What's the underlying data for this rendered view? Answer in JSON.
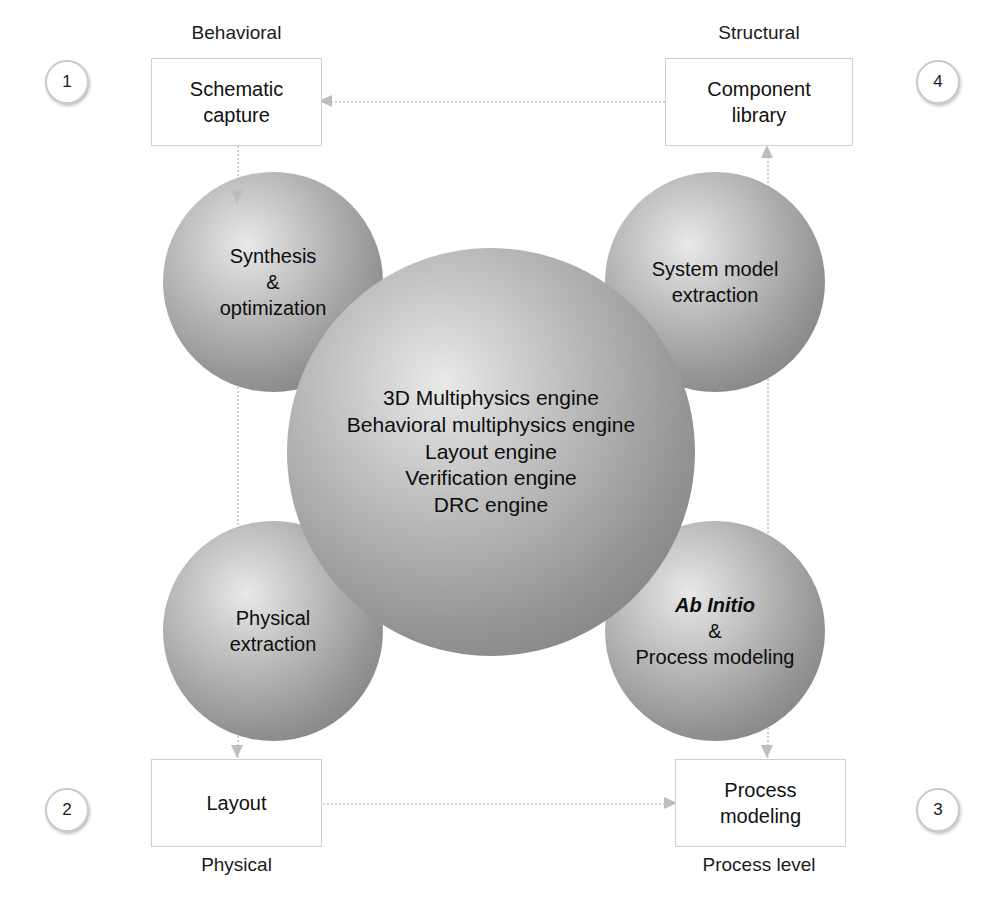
{
  "diagram": {
    "zone_captions": [
      {
        "id": "behavioral",
        "label": "Behavioral"
      },
      {
        "id": "structural",
        "label": "Structural"
      },
      {
        "id": "physical",
        "label": "Physical"
      },
      {
        "id": "process-level",
        "label": "Process level"
      }
    ],
    "index_markers": [
      {
        "id": "marker-1",
        "label": "1",
        "corner": "top-left"
      },
      {
        "id": "marker-4",
        "label": "4",
        "corner": "top-right"
      },
      {
        "id": "marker-2",
        "label": "2",
        "corner": "bottom-left"
      },
      {
        "id": "marker-3",
        "label": "3",
        "corner": "bottom-right"
      }
    ],
    "boxes": [
      {
        "id": "schematic-capture",
        "line1": "Schematic",
        "line2": "capture"
      },
      {
        "id": "component-library",
        "line1": "Component",
        "line2": "library"
      },
      {
        "id": "layout",
        "line1": "Layout",
        "line2": ""
      },
      {
        "id": "process-modeling",
        "line1": "Process",
        "line2": "modeling"
      }
    ],
    "core_sphere": {
      "id": "engine-core",
      "lines": [
        "3D Multiphysics engine",
        "Behavioral multiphysics engine",
        "Layout engine",
        "Verification engine",
        "DRC engine"
      ]
    },
    "satellite_spheres": [
      {
        "id": "synthesis-optimization",
        "position": "top-left",
        "lines": [
          "Synthesis",
          "&",
          "optimization"
        ],
        "italic_first_line": false
      },
      {
        "id": "system-model-extraction",
        "position": "top-right",
        "lines": [
          "System model",
          "extraction"
        ],
        "italic_first_line": false
      },
      {
        "id": "physical-extraction",
        "position": "bottom-left",
        "lines": [
          "Physical",
          "extraction"
        ],
        "italic_first_line": false
      },
      {
        "id": "ab-initio-process-modeling",
        "position": "bottom-right",
        "lines": [
          "Ab Initio",
          "&",
          "Process modeling"
        ],
        "italic_first_line": true
      }
    ],
    "connectors": [
      {
        "id": "component-library-to-schematic-capture",
        "direction": "left",
        "style": "dotted"
      },
      {
        "id": "layout-to-process-modeling",
        "direction": "right",
        "style": "dotted"
      },
      {
        "id": "schematic-capture-to-synthesis",
        "direction": "down",
        "style": "dotted"
      },
      {
        "id": "physical-extraction-to-layout",
        "direction": "down",
        "style": "dotted"
      },
      {
        "id": "system-model-extraction-to-library",
        "direction": "up",
        "style": "dotted"
      },
      {
        "id": "process-modeling-to-ab-initio",
        "direction": "down",
        "style": "dotted"
      }
    ],
    "colors": {
      "background": "#ffffff",
      "box_border": "#cfcfcf",
      "connector": "#d2d2d2",
      "arrowhead": "#bdbdbd",
      "sphere_highlight": "#e9e9e9",
      "sphere_shadow": "#818181",
      "text": "#111111"
    }
  }
}
